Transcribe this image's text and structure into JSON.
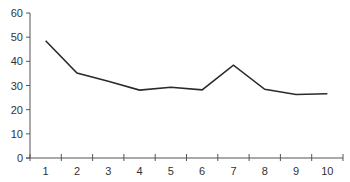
{
  "chart_data": {
    "type": "line",
    "title": "",
    "xlabel": "",
    "ylabel": "",
    "categories": [
      "1",
      "2",
      "3",
      "4",
      "5",
      "6",
      "7",
      "8",
      "9",
      "10"
    ],
    "series": [
      {
        "name": "series-1",
        "values": [
          48.5,
          35.2,
          31.8,
          28.1,
          29.3,
          28.2,
          38.4,
          28.4,
          26.3,
          26.6
        ]
      }
    ],
    "ylim": [
      0,
      60
    ],
    "yticks": [
      "0",
      "10",
      "20",
      "30",
      "40",
      "50",
      "60"
    ],
    "grid": false,
    "legend": "none",
    "colors": {
      "line": "#2b2b2b",
      "axis": "#555555",
      "text": "#333333"
    }
  }
}
